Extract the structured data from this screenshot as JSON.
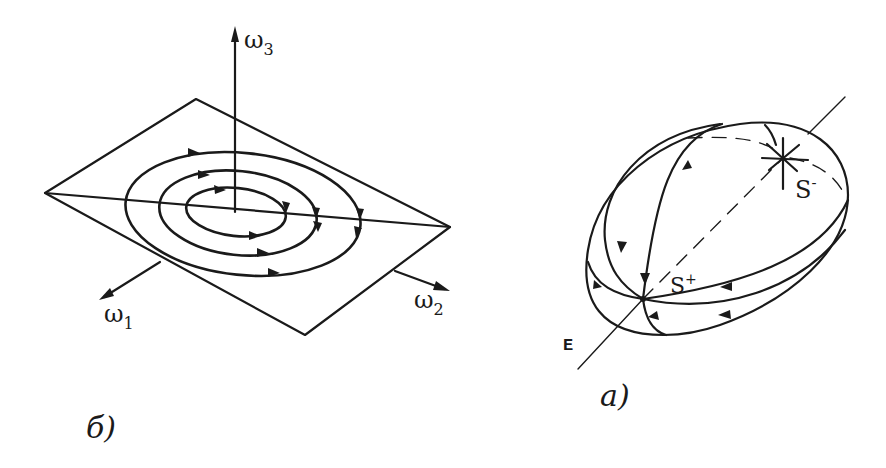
{
  "panels": {
    "b": {
      "caption": "б)",
      "axes": {
        "omega1": {
          "symbol": "ω",
          "subscript": "1"
        },
        "omega2": {
          "symbol": "ω",
          "subscript": "2"
        },
        "omega3": {
          "symbol": "ω",
          "subscript": "3"
        }
      },
      "description": "Plane in (ω1, ω2, ω3) space with three concentric closed orbits circulating around the ω3 axis"
    },
    "a": {
      "caption": "a)",
      "line_label": "E",
      "points": {
        "s_plus": {
          "symbol": "S",
          "superscript": "+"
        },
        "s_minus": {
          "symbol": "S",
          "superscript": "-"
        }
      },
      "description": "Ellipsoid with trajectories flowing from unstable node S- to stable node S+ along axis E"
    }
  }
}
